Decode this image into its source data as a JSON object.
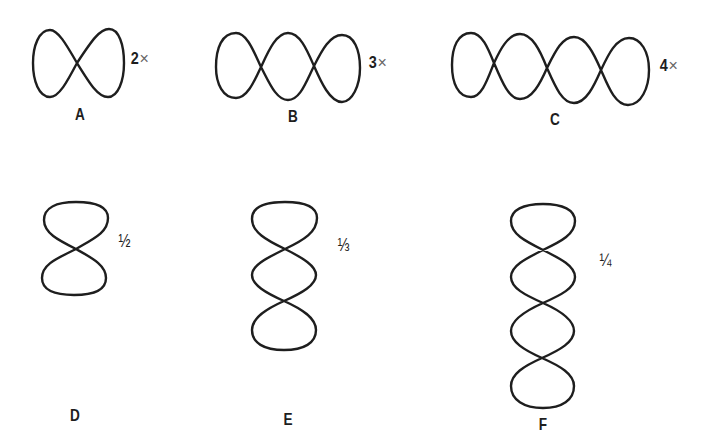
{
  "figures": [
    {
      "id": "A",
      "label": "A",
      "ratio_number": "2",
      "ratio_symbol": "×",
      "orientation": "horizontal",
      "loops": 2
    },
    {
      "id": "B",
      "label": "B",
      "ratio_number": "3",
      "ratio_symbol": "×",
      "orientation": "horizontal",
      "loops": 3
    },
    {
      "id": "C",
      "label": "C",
      "ratio_number": "4",
      "ratio_symbol": "×",
      "orientation": "horizontal",
      "loops": 4
    },
    {
      "id": "D",
      "label": "D",
      "ratio": "½",
      "orientation": "vertical",
      "loops": 2
    },
    {
      "id": "E",
      "label": "E",
      "ratio": "⅓",
      "orientation": "vertical",
      "loops": 3
    },
    {
      "id": "F",
      "label": "F",
      "ratio": "¼",
      "orientation": "vertical",
      "loops": 4
    }
  ],
  "colors": {
    "stroke": "#1e1e1e",
    "background": "#ffffff"
  }
}
